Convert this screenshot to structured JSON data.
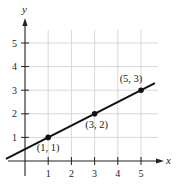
{
  "chart_data": {
    "type": "line",
    "title": "",
    "xlabel": "x",
    "ylabel": "y",
    "xlim": [
      -1,
      5.8
    ],
    "ylim": [
      -0.5,
      6
    ],
    "x_ticks": [
      "1",
      "2",
      "3",
      "4",
      "5"
    ],
    "y_ticks": [
      "1",
      "2",
      "3",
      "4",
      "5"
    ],
    "grid": true,
    "series": [
      {
        "name": "line",
        "x": [
          1,
          3,
          5
        ],
        "y": [
          1,
          2,
          3
        ],
        "equation": "y = 0.5x + 0.5"
      }
    ],
    "points": [
      {
        "x": 1,
        "y": 1,
        "label": "(1, 1)"
      },
      {
        "x": 3,
        "y": 2,
        "label": "(3, 2)"
      },
      {
        "x": 5,
        "y": 3,
        "label": "(5, 3)"
      }
    ],
    "colors": {
      "line": "#111111",
      "grid": "#d8d8d8",
      "axis": "#222222"
    }
  }
}
